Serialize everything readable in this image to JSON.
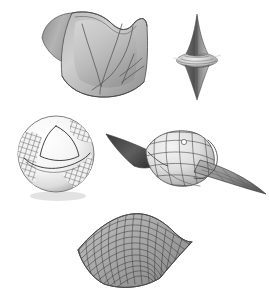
{
  "figure": {
    "background_color": "#ffffff",
    "width": 269,
    "height": 298,
    "style": "grayscale shaded 3D renderings, no captions or labels visible"
  },
  "palette": {
    "background": "#ffffff",
    "ink_dark": "#2e2e2e",
    "ink_mid": "#4a4a4a",
    "ink_light": "#6b6b6b",
    "shade_dark": "#6e6e6e",
    "shade_mid": "#9a9a9a",
    "shade_light": "#c9c9c9",
    "highlight": "#eaeaea",
    "shadow": "#d8d8d8"
  },
  "objects": [
    {
      "id": "saddle-patch",
      "name": "Shaded saddle surface patch with curvature lines",
      "position": "top-left",
      "bbox": {
        "x": 38,
        "y": 8,
        "width": 112,
        "height": 90
      },
      "shading": "smooth gradient, light from upper-left",
      "features": [
        "concave upper rim",
        "folded left flap",
        "V-shaped curve lines",
        "pair of crossing curves at lower right"
      ],
      "mesh": "none (smooth shaded)",
      "curve_count": 5
    },
    {
      "id": "spindle-surface",
      "name": "Spindle surface of revolution (hyperboloid-type cusp)",
      "position": "top-right",
      "bbox": {
        "x": 178,
        "y": 14,
        "width": 36,
        "height": 84
      },
      "shading": "dark axial core with light flared equator",
      "features": [
        "sharp upper cusp",
        "flared equatorial disc",
        "sharp lower cusp"
      ],
      "mesh": "fine horizontal rings near equator",
      "ring_count": 7
    },
    {
      "id": "sphere-geodesic-triangle",
      "name": "Sphere with geodesic triangle and hatched patches",
      "position": "middle-left",
      "bbox": {
        "x": 16,
        "y": 116,
        "width": 82,
        "height": 82
      },
      "shading": "white sphere, speckled grid hatching on side regions",
      "features": [
        "spherical triangle outlined on front",
        "quad-hatch patches on left limb and lower right",
        "contact shadow beneath"
      ],
      "mesh": "quad hatch patches",
      "triangle_vertices": 3
    },
    {
      "id": "pseudosphere",
      "name": "Pseudosphere / tractricoid double horn with quad mesh",
      "position": "middle-right",
      "bbox": {
        "x": 108,
        "y": 130,
        "width": 156,
        "height": 64
      },
      "shading": "light mesh body, dark interior of left funnel",
      "features": [
        "long tapering spike to upper-left",
        "bulbous mesh bell",
        "long tapering spike to lower-right"
      ],
      "mesh": "quadrilateral parameter grid",
      "mesh_rows": 7,
      "mesh_cols": 12
    },
    {
      "id": "hyperbolic-paraboloid",
      "name": "Hyperbolic paraboloid (saddle) rendered as a quad mesh",
      "position": "bottom-center",
      "bbox": {
        "x": 74,
        "y": 210,
        "width": 122,
        "height": 80
      },
      "shading": "mid-gray faces with dark grid lines",
      "features": [
        "upturned right edge",
        "downturned front-right corner",
        "regular rectangular grid"
      ],
      "mesh": "quadrilateral parameter grid",
      "mesh_rows": 13,
      "mesh_cols": 15
    }
  ],
  "chart_data": {
    "type": "scatter",
    "title": "",
    "xlabel": "",
    "ylabel": "",
    "note": "Not a data chart — a plate of five rendered mathematical surfaces.",
    "categories": [
      "saddle-patch",
      "spindle-surface",
      "sphere-geodesic-triangle",
      "pseudosphere",
      "hyperbolic-paraboloid"
    ],
    "values": [
      1,
      1,
      1,
      1,
      1
    ]
  }
}
